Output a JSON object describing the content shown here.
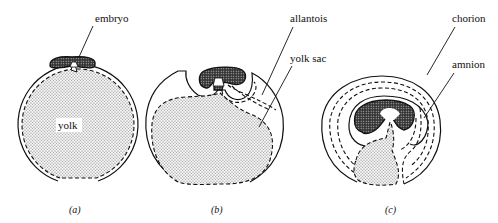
{
  "figure": {
    "panels": [
      {
        "caption": "(a)",
        "labels": {
          "embryo": "embryo",
          "yolk": "yolk"
        }
      },
      {
        "caption": "(b)",
        "labels": {
          "allantois": "allantois",
          "yolk_sac": "yolk sac"
        }
      },
      {
        "caption": "(c)",
        "labels": {
          "chorion": "chorion",
          "amnion": "amnion"
        }
      }
    ]
  }
}
